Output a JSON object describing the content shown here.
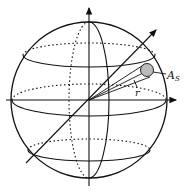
{
  "diagram": {
    "labels": {
      "area": "A",
      "area_sub": "S",
      "radius": "r"
    },
    "colors": {
      "stroke": "#111111",
      "disk_fill": "#bbbbbb",
      "background": "#ffffff"
    }
  }
}
